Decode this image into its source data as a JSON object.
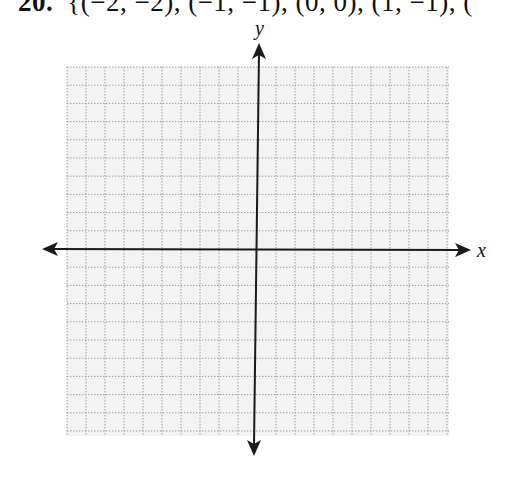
{
  "problem": {
    "number": "20.",
    "set_text": "{(−2, −2), (−1, −1), (0, 0), (1, −1), ("
  },
  "graph": {
    "x_axis_label": "x",
    "y_axis_label": "y",
    "grid": {
      "cells_left_of_origin": 10,
      "cells_right_of_origin": 10,
      "cells_above_origin": 10,
      "cells_below_origin": 10,
      "line_style": "dotted",
      "background_color": "#f3f3f3",
      "line_color": "#9a9a9a"
    },
    "axis_color": "#1a1a1a"
  }
}
